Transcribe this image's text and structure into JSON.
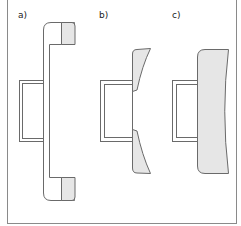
{
  "panels": [
    {
      "label": "a)"
    },
    {
      "label": "b)"
    },
    {
      "label": "c)"
    }
  ],
  "colors": {
    "stroke": "#5a5a5a",
    "fill_shaded": "#e6e6e6",
    "frame": "#8a8a8a"
  }
}
